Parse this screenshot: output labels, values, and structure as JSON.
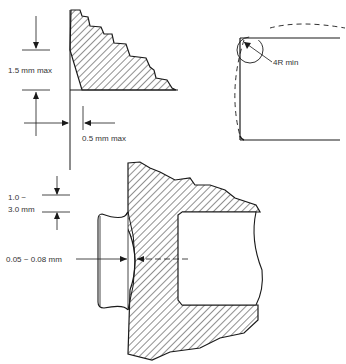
{
  "diagram": {
    "type": "technical drawing",
    "panels": {
      "top_left": {
        "description": "Burr / chamfer cross-section with hatched material",
        "labels": {
          "height_max": "1.5 mm max",
          "width_max": "0.5 mm max"
        }
      },
      "top_right": {
        "description": "Corner radius detail with dashed outline",
        "labels": {
          "radius": "4R min"
        }
      },
      "bottom": {
        "description": "Sectional view of bore with seated plug and bulge",
        "labels": {
          "rim_top": "1.0 ~",
          "rim_bottom": "3.0 mm",
          "gap": "0.05 ~ 0.08 mm"
        }
      }
    },
    "colors": {
      "line": "#1a1a1a",
      "text": "#333333",
      "background": "#ffffff"
    }
  }
}
